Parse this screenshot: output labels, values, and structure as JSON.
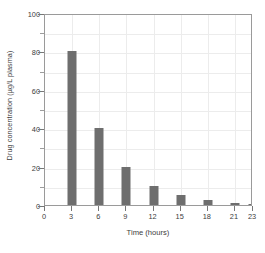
{
  "chart_data": {
    "type": "bar",
    "title": "",
    "xlabel": "Time (hours)",
    "ylabel": "Drug concentration (µg/L plasma)",
    "categories": [
      "0",
      "3",
      "6",
      "9",
      "12",
      "15",
      "18",
      "21",
      "23"
    ],
    "x": [
      0,
      3,
      6,
      9,
      12,
      15,
      18,
      21,
      23
    ],
    "values": [
      0,
      80,
      40,
      20,
      10,
      5,
      2.5,
      1.2,
      0.6
    ],
    "xlim": [
      0,
      23
    ],
    "ylim": [
      0,
      100
    ],
    "ytick_labels": [
      "0",
      "20",
      "40",
      "60",
      "80",
      "100"
    ],
    "yticks_major": [
      0,
      20,
      40,
      60,
      80,
      100
    ],
    "yticks_minor": [
      10,
      30,
      50,
      70,
      90
    ],
    "xtick_labels": [
      "0",
      "3",
      "6",
      "9",
      "12",
      "15",
      "18",
      "21",
      "23"
    ],
    "grid": true,
    "legend": "none",
    "bar_color": "#6e6e6e",
    "grid_color": "#ececec",
    "frame_color": "#9a9a9a",
    "background": "#ffffff"
  }
}
